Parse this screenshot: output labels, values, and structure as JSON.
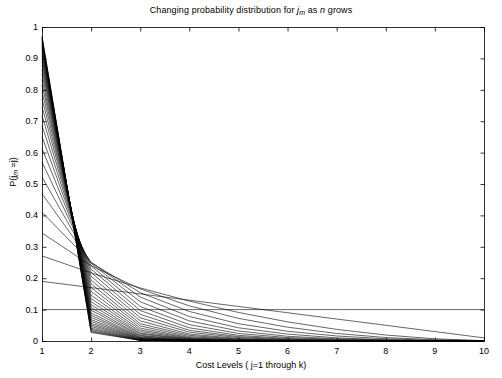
{
  "figure": {
    "width": 502,
    "height": 378,
    "background_color": "#ffffff",
    "line_color": "#000000",
    "axis_color": "#000000"
  },
  "chart_data": {
    "type": "line",
    "title_parts": {
      "prefix": "Changing probability distribution for ",
      "var1": "j",
      "var1_sub": "m",
      "middle": " as ",
      "var2": "n",
      "suffix": " grows"
    },
    "xlabel": "Cost Levels ( j=1 through k)",
    "xlabel_parts": {
      "prefix": "Cost Levels ( ",
      "var1": "j",
      "middle": "=1 through ",
      "var2": "k",
      "suffix": ")"
    },
    "ylabel": "P(j_m =j)",
    "ylabel_parts": {
      "prefix": "P(",
      "var1": "j",
      "var1_sub": "m",
      "middle": " =",
      "var2": "j",
      "suffix": ")"
    },
    "xlim": [
      1,
      10
    ],
    "ylim": [
      0,
      1
    ],
    "xticks": [
      1,
      2,
      3,
      4,
      5,
      6,
      7,
      8,
      9,
      10
    ],
    "xticklabels": [
      "1",
      "2",
      "3",
      "4",
      "5",
      "6",
      "7",
      "8",
      "9",
      "10"
    ],
    "yticks": [
      0,
      0.1,
      0.2,
      0.3,
      0.4,
      0.5,
      0.6,
      0.7,
      0.8,
      0.9,
      1
    ],
    "yticklabels": [
      "0",
      "0.1",
      "0.2",
      "0.3",
      "0.4",
      "0.5",
      "0.6",
      "0.7",
      "0.8",
      "0.9",
      "1"
    ],
    "grid": false,
    "legend": null,
    "legend_position": "none",
    "x": [
      1,
      2,
      3,
      4,
      5,
      6,
      7,
      8,
      9,
      10
    ],
    "series": [
      {
        "name": "n=1",
        "values": [
          0.1,
          0.1,
          0.1,
          0.1,
          0.1,
          0.1,
          0.1,
          0.1,
          0.1,
          0.1
        ]
      },
      {
        "name": "n=2",
        "values": [
          0.19,
          0.17,
          0.15,
          0.13,
          0.11,
          0.09,
          0.07,
          0.05,
          0.03,
          0.01
        ]
      },
      {
        "name": "n=3",
        "values": [
          0.271,
          0.217,
          0.169,
          0.127,
          0.091,
          0.061,
          0.037,
          0.019,
          0.007,
          0.001
        ]
      },
      {
        "name": "n=4",
        "values": [
          0.344,
          0.24,
          0.166,
          0.112,
          0.072,
          0.044,
          0.024,
          0.011,
          0.004,
          0.001
        ]
      },
      {
        "name": "n=5",
        "values": [
          0.41,
          0.25,
          0.154,
          0.094,
          0.055,
          0.031,
          0.016,
          0.007,
          0.002,
          0.0
        ]
      },
      {
        "name": "n=6",
        "values": [
          0.469,
          0.251,
          0.14,
          0.078,
          0.042,
          0.022,
          0.01,
          0.004,
          0.001,
          0.0
        ]
      },
      {
        "name": "n=7",
        "values": [
          0.522,
          0.247,
          0.125,
          0.064,
          0.032,
          0.015,
          0.007,
          0.003,
          0.001,
          0.0
        ]
      },
      {
        "name": "n=8",
        "values": [
          0.57,
          0.239,
          0.11,
          0.052,
          0.024,
          0.011,
          0.005,
          0.002,
          0.0,
          0.0
        ]
      },
      {
        "name": "n=9",
        "values": [
          0.613,
          0.229,
          0.097,
          0.042,
          0.018,
          0.008,
          0.003,
          0.001,
          0.0,
          0.0
        ]
      },
      {
        "name": "n=10",
        "values": [
          0.651,
          0.218,
          0.085,
          0.034,
          0.014,
          0.006,
          0.002,
          0.001,
          0.0,
          0.0
        ]
      },
      {
        "name": "n=11",
        "values": [
          0.686,
          0.206,
          0.074,
          0.028,
          0.011,
          0.004,
          0.002,
          0.001,
          0.0,
          0.0
        ]
      },
      {
        "name": "n=12",
        "values": [
          0.718,
          0.194,
          0.064,
          0.022,
          0.008,
          0.003,
          0.001,
          0.0,
          0.0,
          0.0
        ]
      },
      {
        "name": "n=13",
        "values": [
          0.746,
          0.182,
          0.055,
          0.018,
          0.006,
          0.002,
          0.001,
          0.0,
          0.0,
          0.0
        ]
      },
      {
        "name": "n=14",
        "values": [
          0.771,
          0.17,
          0.048,
          0.014,
          0.005,
          0.002,
          0.001,
          0.0,
          0.0,
          0.0
        ]
      },
      {
        "name": "n=15",
        "values": [
          0.794,
          0.158,
          0.041,
          0.011,
          0.003,
          0.001,
          0.0,
          0.0,
          0.0,
          0.0
        ]
      },
      {
        "name": "n=16",
        "values": [
          0.815,
          0.146,
          0.035,
          0.009,
          0.003,
          0.001,
          0.0,
          0.0,
          0.0,
          0.0
        ]
      },
      {
        "name": "n=17",
        "values": [
          0.833,
          0.135,
          0.03,
          0.007,
          0.002,
          0.001,
          0.0,
          0.0,
          0.0,
          0.0
        ]
      },
      {
        "name": "n=18",
        "values": [
          0.85,
          0.125,
          0.025,
          0.006,
          0.001,
          0.0,
          0.0,
          0.0,
          0.0,
          0.0
        ]
      },
      {
        "name": "n=19",
        "values": [
          0.865,
          0.115,
          0.022,
          0.005,
          0.001,
          0.0,
          0.0,
          0.0,
          0.0,
          0.0
        ]
      },
      {
        "name": "n=20",
        "values": [
          0.878,
          0.106,
          0.018,
          0.004,
          0.001,
          0.0,
          0.0,
          0.0,
          0.0,
          0.0
        ]
      },
      {
        "name": "n=21",
        "values": [
          0.89,
          0.098,
          0.016,
          0.003,
          0.001,
          0.0,
          0.0,
          0.0,
          0.0,
          0.0
        ]
      },
      {
        "name": "n=22",
        "values": [
          0.901,
          0.089,
          0.013,
          0.002,
          0.0,
          0.0,
          0.0,
          0.0,
          0.0,
          0.0
        ]
      },
      {
        "name": "n=23",
        "values": [
          0.91,
          0.082,
          0.011,
          0.002,
          0.0,
          0.0,
          0.0,
          0.0,
          0.0,
          0.0
        ]
      },
      {
        "name": "n=24",
        "values": [
          0.919,
          0.075,
          0.01,
          0.002,
          0.0,
          0.0,
          0.0,
          0.0,
          0.0,
          0.0
        ]
      },
      {
        "name": "n=25",
        "values": [
          0.927,
          0.068,
          0.008,
          0.001,
          0.0,
          0.0,
          0.0,
          0.0,
          0.0,
          0.0
        ]
      },
      {
        "name": "n=26",
        "values": [
          0.934,
          0.062,
          0.007,
          0.001,
          0.0,
          0.0,
          0.0,
          0.0,
          0.0,
          0.0
        ]
      },
      {
        "name": "n=27",
        "values": [
          0.94,
          0.056,
          0.006,
          0.001,
          0.0,
          0.0,
          0.0,
          0.0,
          0.0,
          0.0
        ]
      },
      {
        "name": "n=28",
        "values": [
          0.946,
          0.051,
          0.005,
          0.001,
          0.0,
          0.0,
          0.0,
          0.0,
          0.0,
          0.0
        ]
      },
      {
        "name": "n=29",
        "values": [
          0.951,
          0.046,
          0.004,
          0.0,
          0.0,
          0.0,
          0.0,
          0.0,
          0.0,
          0.0
        ]
      },
      {
        "name": "n=30",
        "values": [
          0.956,
          0.041,
          0.003,
          0.0,
          0.0,
          0.0,
          0.0,
          0.0,
          0.0,
          0.0
        ]
      },
      {
        "name": "n=31",
        "values": [
          0.961,
          0.037,
          0.003,
          0.0,
          0.0,
          0.0,
          0.0,
          0.0,
          0.0,
          0.0
        ]
      },
      {
        "name": "n=32",
        "values": [
          0.965,
          0.033,
          0.002,
          0.0,
          0.0,
          0.0,
          0.0,
          0.0,
          0.0,
          0.0
        ]
      },
      {
        "name": "n=33",
        "values": [
          0.968,
          0.03,
          0.002,
          0.0,
          0.0,
          0.0,
          0.0,
          0.0,
          0.0,
          0.0
        ]
      },
      {
        "name": "n=34",
        "values": [
          0.971,
          0.027,
          0.002,
          0.0,
          0.0,
          0.0,
          0.0,
          0.0,
          0.0,
          0.0
        ]
      }
    ]
  },
  "plot_area": {
    "left": 42,
    "top": 27,
    "right": 484,
    "bottom": 341
  }
}
